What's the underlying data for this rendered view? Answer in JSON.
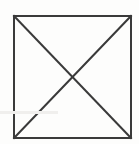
{
  "figure": {
    "type": "line-drawing",
    "background_color": "#fdfdfc",
    "stroke_color": "#3a3a3a",
    "stroke_width": 2,
    "canvas": {
      "width": 139,
      "height": 144
    },
    "caption": "",
    "shapes": {
      "square": {
        "name": "outer-square",
        "x": 14,
        "y": 16,
        "width": 117,
        "height": 122,
        "corners": {
          "top_left": [
            14,
            16
          ],
          "top_right": [
            131,
            16
          ],
          "bottom_right": [
            131,
            138
          ],
          "bottom_left": [
            14,
            138
          ]
        }
      },
      "diagonal_tl_br": {
        "name": "diagonal-top-left-to-bottom-right",
        "x1": 14,
        "y1": 16,
        "x2": 131,
        "y2": 138
      },
      "diagonal_tr_bl": {
        "name": "diagonal-top-right-to-bottom-left",
        "x1": 131,
        "y1": 16,
        "x2": 14,
        "y2": 138
      },
      "intersection": {
        "name": "diagonal-intersection-center",
        "x": 72.5,
        "y": 77
      }
    },
    "artifact": {
      "name": "scan-artifact-streak",
      "x": 0,
      "y": 111,
      "width": 58,
      "height": 3,
      "color": "#f0efed"
    }
  }
}
